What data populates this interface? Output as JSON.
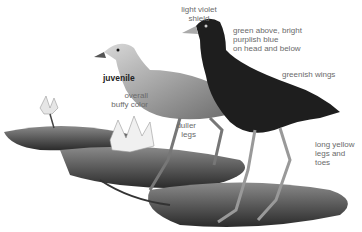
{
  "illustration": {
    "subject": "purple gallinule adult and juvenile on lily pads",
    "labels": {
      "shield": "light violet shield",
      "head_color": "green above, bright purplish blue on head and below",
      "juvenile": "juvenile",
      "juvenile_color": "overall buffy color",
      "wings": "greenish wings",
      "duller_legs": "duller legs",
      "legs": "long yellow legs and toes"
    },
    "label_lines": {
      "shield": [
        "light violet",
        "shield"
      ],
      "head_color": [
        "green above, bright",
        "purplish blue",
        "on head and below"
      ],
      "juvenile_color": [
        "overall",
        "buffy color"
      ],
      "duller_legs": [
        "duller",
        "legs"
      ],
      "legs": [
        "long yellow",
        "legs and",
        "toes"
      ]
    }
  }
}
